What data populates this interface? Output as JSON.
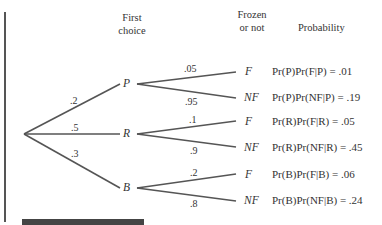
{
  "headers": {
    "first_choice_1": "First",
    "first_choice_2": "choice",
    "frozen_1": "Frozen",
    "frozen_2": "or not",
    "probability": "Probability"
  },
  "nodes": {
    "P": "P",
    "R": "R",
    "B": "B",
    "P_F": "F",
    "P_NF": "NF",
    "R_F": "F",
    "R_NF": "NF",
    "B_F": "F",
    "B_NF": "NF"
  },
  "edges": {
    "root_P": ".2",
    "root_R": ".5",
    "root_B": ".3",
    "P_F": ".05",
    "P_NF": ".95",
    "R_F": ".1",
    "R_NF": ".9",
    "B_F": ".2",
    "B_NF": ".8"
  },
  "probabilities": [
    {
      "text": "Pr(P)Pr(F|P) = .01"
    },
    {
      "text": "Pr(P)Pr(NF|P) = .19"
    },
    {
      "text": "Pr(R)Pr(F|R) = .05"
    },
    {
      "text": "Pr(R)Pr(NF|R) = .45"
    },
    {
      "text": "Pr(B)Pr(F|B) = .06"
    },
    {
      "text": "Pr(B)Pr(NF|B) = .24"
    }
  ],
  "colors": {
    "line": "#555555",
    "text": "#333333"
  }
}
